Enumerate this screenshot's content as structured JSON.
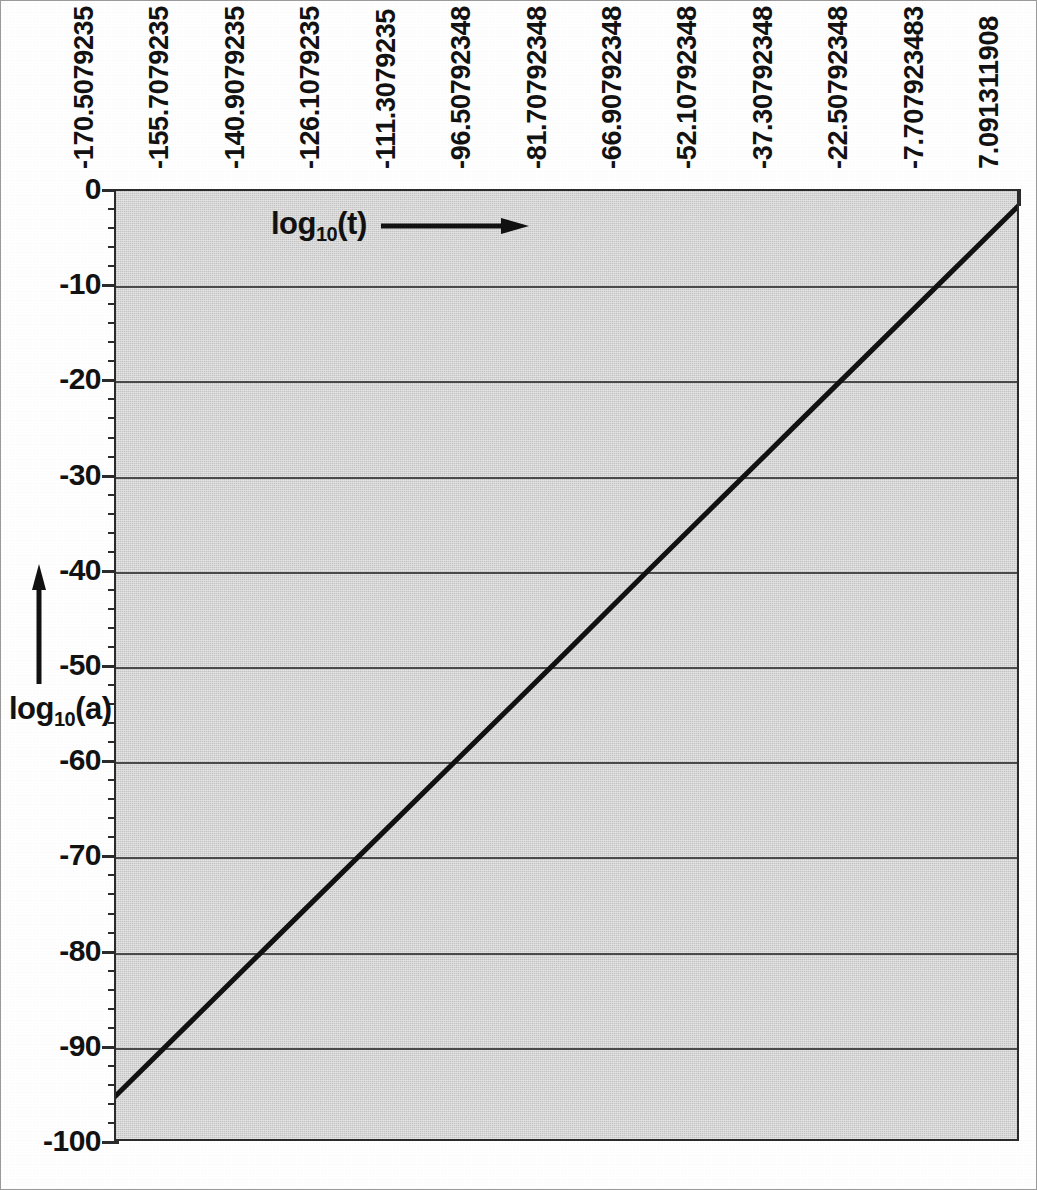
{
  "chart_data": {
    "type": "line",
    "title": "",
    "subtitle": "",
    "xlabel": "log10(t)",
    "ylabel": "log10(a)",
    "xlabel_display": "log",
    "xlabel_sub": "10",
    "xlabel_tail": "(t)",
    "ylabel_display": "log",
    "ylabel_sub": "10",
    "ylabel_tail": "(a)",
    "xlabel_arrow": "arrow-right",
    "ylabel_arrow": "arrow-up",
    "grid": true,
    "grid_axis": "y",
    "legend": false,
    "legend_position": "none",
    "plot_bgcolor": "#d2d2d2",
    "line_color": "#111111",
    "line_width": 5,
    "axis_color": "#2b2b2b",
    "gridline_color": "#4a4a4a",
    "x_axis_position": "top",
    "x_tick_labels_rotation": -90,
    "categories": [
      "-170.5079235",
      "-155.7079235",
      "-140.9079235",
      "-126.1079235",
      "-111.3079235",
      "-96.50792348",
      "-81.70792348",
      "-66.90792348",
      "-52.10792348",
      "-37.30792348",
      "-22.50792348",
      "-7.707923483",
      "7.091311908"
    ],
    "x": [
      -170.5079235,
      -155.7079235,
      -140.9079235,
      -126.1079235,
      -111.3079235,
      -96.50792348,
      -81.70792348,
      -66.90792348,
      -52.10792348,
      -37.30792348,
      -22.50792348,
      -7.707923483,
      7.091311908
    ],
    "values": [
      -95.0,
      -87.2,
      -79.4,
      -71.6,
      -63.8,
      -56.0,
      -48.2,
      -40.3,
      -32.5,
      -24.7,
      -16.9,
      -9.1,
      -1.3
    ],
    "series": [
      {
        "name": "log10(a)",
        "values": [
          -95.0,
          -87.2,
          -79.4,
          -71.6,
          -63.8,
          -56.0,
          -48.2,
          -40.3,
          -32.5,
          -24.7,
          -16.9,
          -9.1,
          -1.3
        ]
      }
    ],
    "ylim": [
      -100,
      0
    ],
    "xlim": [
      -170.5079235,
      7.091311908
    ],
    "y_ticks": [
      0,
      -10,
      -20,
      -30,
      -40,
      -50,
      -60,
      -70,
      -80,
      -90,
      -100
    ],
    "y_tick_labels": [
      "0",
      "-10",
      "-20",
      "-30",
      "-40",
      "-50",
      "-60",
      "-70",
      "-80",
      "-90",
      "-100"
    ],
    "y_minor_tick_interval": 2,
    "annotations": []
  }
}
